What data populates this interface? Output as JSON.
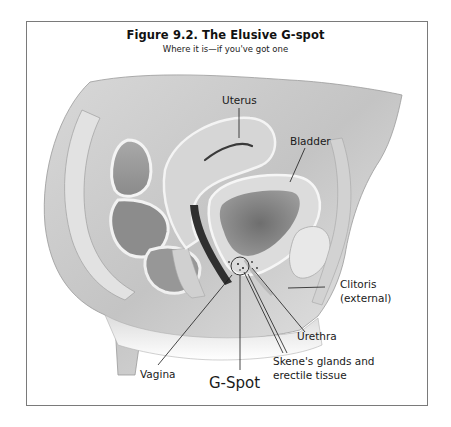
{
  "figure": {
    "title": "Figure 9.2. The Elusive G-spot",
    "subtitle": "Where it is—if you've got one"
  },
  "labels": {
    "uterus": "Uterus",
    "bladder": "Bladder",
    "clitoris_line1": "Clitoris",
    "clitoris_line2": "(external)",
    "urethra": "Urethra",
    "skenes_line1": "Skene's glands and",
    "skenes_line2": "erectile tissue",
    "vagina": "Vagina",
    "gspot": "G-Spot"
  },
  "colors": {
    "frame_border": "#7a7a7a",
    "background": "#ffffff",
    "tissue_light": "#e6e6e6",
    "tissue_mid": "#bdbdbd",
    "tissue_dark": "#7c7c7c",
    "leader_line": "#1a1a1a"
  }
}
